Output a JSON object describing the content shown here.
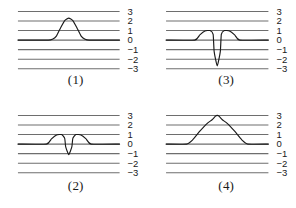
{
  "figure": {
    "background": "#ffffff",
    "gridline_color": "#6e6e6e",
    "curve_color": "#1a1a1a",
    "axis_label_color": "#1a1a1a",
    "panel_count": 4
  },
  "axis": {
    "ticks": [
      "3",
      "2",
      "1",
      "0",
      "−1",
      "−2",
      "−3"
    ],
    "tick_values": [
      3,
      2,
      1,
      0,
      -1,
      -2,
      -3
    ],
    "ymin": -3,
    "ymax": 3
  },
  "panels": [
    {
      "caption": "(1)",
      "position": "top-left",
      "description": "single narrow upward bump on zero baseline",
      "baseline": 0,
      "peak": 2.3,
      "ticks": [
        "3",
        "2",
        "1",
        "0",
        "−1",
        "−2",
        "−3"
      ]
    },
    {
      "caption": "(3)",
      "position": "top-right",
      "description": "deep narrow downward spike flanked by two small humps",
      "baseline": 0,
      "peak": 1.0,
      "trough": -2.7,
      "ticks": [
        "3",
        "2",
        "1",
        "0",
        "−1",
        "−2",
        "−3"
      ]
    },
    {
      "caption": "(2)",
      "position": "bottom-left",
      "description": "shallow narrow downward dip flanked by two small humps",
      "baseline": 0,
      "peak": 1.0,
      "trough": -1.1,
      "ticks": [
        "3",
        "2",
        "1",
        "0",
        "−1",
        "−2",
        "−3"
      ]
    },
    {
      "caption": "(4)",
      "position": "bottom-right",
      "description": "broad tall upward bump on zero baseline",
      "baseline": 0,
      "peak": 3.0,
      "ticks": [
        "3",
        "2",
        "1",
        "0",
        "−1",
        "−2",
        "−3"
      ]
    }
  ],
  "chart_data": {
    "type": "line",
    "title": "",
    "xlabel": "",
    "ylabel": "",
    "ylim": [
      -3,
      3
    ],
    "grid": true,
    "gridlines": [
      3,
      2,
      1,
      0,
      -1,
      -2,
      -3
    ],
    "legend": "none",
    "subplots": [
      {
        "label": "(1)",
        "x": [
          0,
          0.3,
          0.34,
          0.38,
          0.42,
          0.46,
          0.5,
          0.54,
          0.58,
          0.62,
          0.66,
          0.7,
          1.0
        ],
        "y": [
          0,
          0,
          0.1,
          0.45,
          1.3,
          2.05,
          2.3,
          2.05,
          1.3,
          0.45,
          0.1,
          0,
          0
        ]
      },
      {
        "label": "(3)",
        "x": [
          0,
          0.28,
          0.33,
          0.38,
          0.43,
          0.46,
          0.47,
          0.5,
          0.53,
          0.54,
          0.57,
          0.62,
          0.67,
          0.72,
          1.0
        ],
        "y": [
          0,
          0,
          0.55,
          0.95,
          1.0,
          0.6,
          -1.2,
          -2.7,
          -1.2,
          0.6,
          1.0,
          0.95,
          0.55,
          0,
          0
        ]
      },
      {
        "label": "(2)",
        "x": [
          0,
          0.28,
          0.33,
          0.38,
          0.43,
          0.46,
          0.47,
          0.5,
          0.53,
          0.54,
          0.57,
          0.62,
          0.67,
          0.72,
          1.0
        ],
        "y": [
          0,
          0,
          0.55,
          0.95,
          1.0,
          0.6,
          -0.3,
          -1.1,
          -0.3,
          0.6,
          1.0,
          0.95,
          0.55,
          0,
          0
        ]
      },
      {
        "label": "(4)",
        "x": [
          0,
          0.2,
          0.26,
          0.33,
          0.4,
          0.45,
          0.48,
          0.5,
          0.52,
          0.55,
          0.6,
          0.67,
          0.74,
          0.8,
          1.0
        ],
        "y": [
          0,
          0,
          0.45,
          1.35,
          2.15,
          2.55,
          2.9,
          3.0,
          2.9,
          2.55,
          2.15,
          1.35,
          0.45,
          0,
          0
        ]
      }
    ]
  }
}
